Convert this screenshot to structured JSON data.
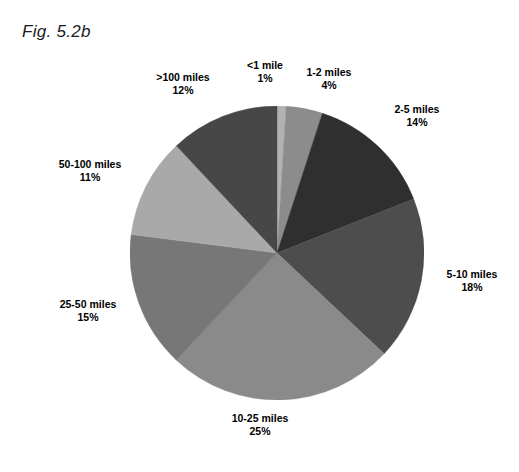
{
  "figure": {
    "title": "Fig. 5.2b"
  },
  "chart_data": {
    "type": "pie",
    "title": "Fig. 5.2b",
    "xlabel": "",
    "ylabel": "",
    "legend_position": "none",
    "grid": false,
    "value_unit": "%",
    "start_angle_deg": 0,
    "direction": "clockwise",
    "categories": [
      "<1 mile",
      "1-2 miles",
      "2-5 miles",
      "5-10 miles",
      "10-25 miles",
      "25-50 miles",
      "50-100 miles",
      ">100 miles"
    ],
    "values": [
      1,
      4,
      14,
      18,
      25,
      15,
      11,
      12
    ],
    "total": 100,
    "slices": [
      {
        "label": "<1 mile",
        "value": 1,
        "value_text": "1%",
        "color": "#b2b2b2"
      },
      {
        "label": "1-2 miles",
        "value": 4,
        "value_text": "4%",
        "color": "#8c8c8c"
      },
      {
        "label": "2-5 miles",
        "value": 14,
        "value_text": "14%",
        "color": "#2f2f2f"
      },
      {
        "label": "5-10 miles",
        "value": 18,
        "value_text": "18%",
        "color": "#4d4d4d"
      },
      {
        "label": "10-25 miles",
        "value": 25,
        "value_text": "25%",
        "color": "#8a8a8a"
      },
      {
        "label": "25-50 miles",
        "value": 15,
        "value_text": "15%",
        "color": "#777777"
      },
      {
        "label": "50-100 miles",
        "value": 11,
        "value_text": "11%",
        "color": "#a9a9a9"
      },
      {
        "label": ">100 miles",
        "value": 12,
        "value_text": "12%",
        "color": "#474747"
      }
    ]
  }
}
